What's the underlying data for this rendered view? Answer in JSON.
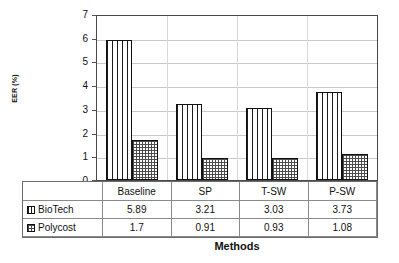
{
  "chart_data": {
    "type": "bar",
    "title": "",
    "xlabel": "Methods",
    "ylabel": "EER (%)",
    "categories": [
      "Baseline",
      "SP",
      "T-SW",
      "P-SW"
    ],
    "series": [
      {
        "name": "BioTech",
        "values": [
          5.89,
          3.21,
          3.03,
          3.73
        ],
        "pattern": "vertical-stripes"
      },
      {
        "name": "Polycost",
        "values": [
          1.7,
          0.91,
          0.93,
          1.08
        ],
        "pattern": "dotted-checker"
      }
    ],
    "ylim": [
      0,
      7
    ],
    "yticks": [
      0,
      1,
      2,
      3,
      4,
      5,
      6,
      7
    ],
    "ytick_labels": [
      "0",
      "1",
      "2",
      "3",
      "4",
      "5",
      "6",
      "7"
    ],
    "grid": true,
    "grid_axis": "y",
    "legend": "data-table-below",
    "colors": {
      "axis": "#4a4a4a",
      "grid": "#c9c9c9",
      "bar_outline": "#111111",
      "pattern_ink": "#1c1c1c",
      "text": "#111111",
      "background": "#ffffff"
    }
  },
  "data_table": {
    "rows": [
      {
        "label": "BioTech",
        "cells": [
          "5.89",
          "3.21",
          "3.03",
          "3.73"
        ]
      },
      {
        "label": "Polycost",
        "cells": [
          "1.7",
          "0.91",
          "0.93",
          "1.08"
        ]
      }
    ],
    "category_row": [
      "Baseline",
      "SP",
      "T-SW",
      "P-SW"
    ]
  }
}
